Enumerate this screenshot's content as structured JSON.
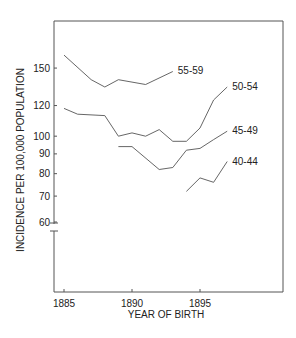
{
  "chart_data": {
    "type": "line",
    "title": "",
    "xlabel": "YEAR OF BIRTH",
    "ylabel": "INCIDENCE PER 100,000 POPULATION",
    "yscale": "log",
    "ylim": [
      60,
      165
    ],
    "xlim": [
      1884.9,
      1901.8
    ],
    "axis_break": "y-axis broken just below 60",
    "grid": false,
    "x_ticks": [
      1885,
      1890,
      1895
    ],
    "y_ticks": [
      60,
      70,
      80,
      90,
      100,
      120,
      150
    ],
    "x_tick_labels": [
      "1885",
      "1890",
      "1895"
    ],
    "y_tick_labels": [
      "60",
      "70",
      "80",
      "90",
      "100",
      "120",
      "150"
    ],
    "legend": "inline labels at series ends",
    "series": [
      {
        "name": "55-59",
        "x": [
          1885,
          1887,
          1888,
          1889,
          1891,
          1893
        ],
        "values": [
          162,
          140,
          134,
          140,
          136,
          147
        ]
      },
      {
        "name": "50-54",
        "x": [
          1885,
          1886,
          1888,
          1889,
          1890,
          1891,
          1892,
          1893,
          1894,
          1895,
          1896,
          1897
        ],
        "values": [
          118,
          114,
          113,
          100,
          102,
          100,
          104,
          97,
          97,
          105,
          124,
          134
        ]
      },
      {
        "name": "45-49",
        "x": [
          1889,
          1890,
          1892,
          1893,
          1894,
          1895,
          1896,
          1897
        ],
        "values": [
          94,
          94,
          82,
          83,
          92,
          93,
          98,
          103
        ]
      },
      {
        "name": "40-44",
        "x": [
          1894,
          1895,
          1896,
          1897
        ],
        "values": [
          72,
          78,
          76,
          86
        ]
      }
    ]
  }
}
